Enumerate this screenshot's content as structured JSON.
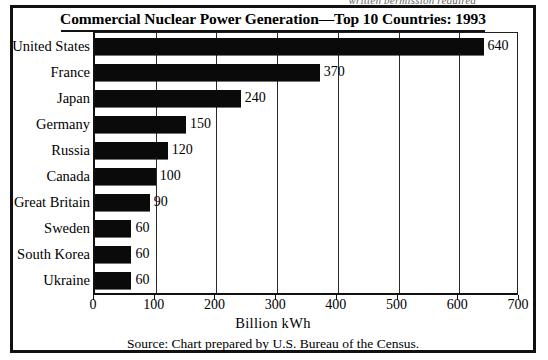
{
  "scan": {
    "top_cutoff_text": "written permission required"
  },
  "figure": {
    "title": "Commercial Nuclear Power Generation—Top 10 Countries: 1993",
    "source_note": "Source: Chart prepared by U.S. Bureau of the Census.",
    "bar_color": "#0a0a0a",
    "border_color": "#111111"
  },
  "chart_data": {
    "type": "bar",
    "orientation": "horizontal",
    "title": "Commercial Nuclear Power Generation—Top 10 Countries: 1993",
    "xlabel": "Billion kWh",
    "ylabel": "",
    "categories": [
      "United States",
      "France",
      "Japan",
      "Germany",
      "Russia",
      "Canada",
      "Great Britain",
      "Sweden",
      "South Korea",
      "Ukraine"
    ],
    "values": [
      640,
      370,
      240,
      150,
      120,
      100,
      90,
      60,
      60,
      60
    ],
    "value_labels": [
      "640",
      "370",
      "240",
      "150",
      "120",
      "100",
      "90",
      "60",
      "60",
      "60"
    ],
    "xlim": [
      0,
      700
    ],
    "xticks": [
      0,
      100,
      200,
      300,
      400,
      500,
      600,
      700
    ],
    "xtick_labels": [
      "0",
      "100",
      "200",
      "300",
      "400",
      "500",
      "600",
      "700"
    ],
    "grid": "vertical",
    "legend": "none",
    "annotations": [
      "Source: Chart prepared by U.S. Bureau of the Census."
    ]
  }
}
